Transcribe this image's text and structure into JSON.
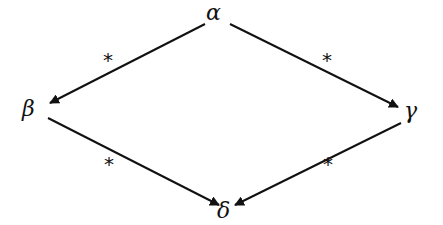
{
  "diagram": {
    "type": "confluence-diamond",
    "nodes": {
      "top": "α",
      "left": "β",
      "right": "γ",
      "bottom": "δ"
    },
    "edges": [
      {
        "from": "α",
        "to": "β",
        "label": "*"
      },
      {
        "from": "α",
        "to": "γ",
        "label": "*"
      },
      {
        "from": "β",
        "to": "δ",
        "label": "*"
      },
      {
        "from": "γ",
        "to": "δ",
        "label": "*"
      }
    ],
    "edge_labels": {
      "top_left": "*",
      "top_right": "*",
      "bottom_left": "*",
      "bottom_right": "*"
    }
  }
}
